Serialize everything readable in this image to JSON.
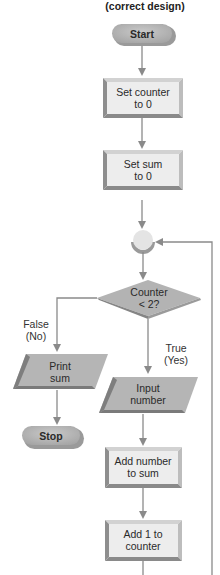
{
  "title": "(correct design)",
  "colors": {
    "line": "#8a8a8a",
    "terminal_fill": "#b8b8b8",
    "process_face": "#ececec",
    "process_bevel_dark": "#8e8e8e",
    "process_bevel_light": "#cfcfcf",
    "io_fill": "#b5b5b5",
    "io_bevel": "#7e7e7e",
    "decision_fill": "#b3b3b3",
    "connector_fill": "#e4e4e4",
    "connector_shadow": "#9a9a9a"
  },
  "nodes": {
    "start": {
      "type": "terminal",
      "label": "Start"
    },
    "set_counter": {
      "type": "process",
      "line1": "Set counter",
      "line2": "to 0"
    },
    "set_sum": {
      "type": "process",
      "line1": "Set sum",
      "line2": "to 0"
    },
    "connector": {
      "type": "connector"
    },
    "decision": {
      "type": "decision",
      "line1": "Counter",
      "line2": "< 2?"
    },
    "print_sum": {
      "type": "io",
      "line1": "Print",
      "line2": "sum"
    },
    "stop": {
      "type": "terminal",
      "label": "Stop"
    },
    "input_number": {
      "type": "io",
      "line1": "Input",
      "line2": "number"
    },
    "add_number": {
      "type": "process",
      "line1": "Add number",
      "line2": "to sum"
    },
    "add_one": {
      "type": "process",
      "line1": "Add 1 to",
      "line2": "counter"
    }
  },
  "edges": {
    "false_branch": {
      "line1": "False",
      "line2": "(No)"
    },
    "true_branch": {
      "line1": "True",
      "line2": "(Yes)"
    }
  }
}
